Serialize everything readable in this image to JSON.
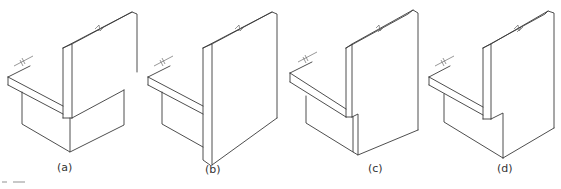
{
  "figure": {
    "panels": [
      {
        "id": "a",
        "label": "(a)",
        "variant": "wall stops on slab; pier box below"
      },
      {
        "id": "b",
        "label": "(b)",
        "variant": "wall continues full height past slab"
      },
      {
        "id": "c",
        "label": "(c)",
        "variant": "wall over notched pier with step"
      },
      {
        "id": "d",
        "label": "(d)",
        "variant": "wall over notched pier, flush"
      }
    ],
    "colors": {
      "line": "#3a3a3a",
      "background": "#ffffff"
    }
  }
}
